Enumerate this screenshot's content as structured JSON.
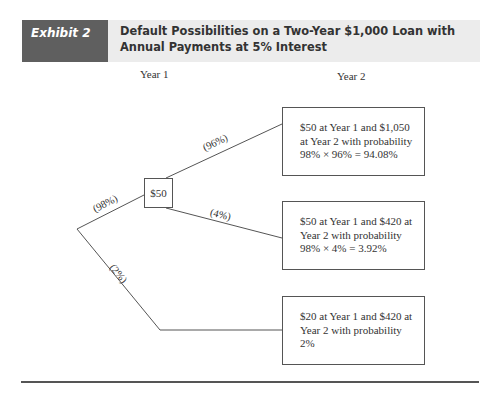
{
  "header": {
    "label": "Exhibit 2",
    "title": "Default Possibilities on a Two-Year $1,000 Loan with Annual Payments at 5% Interest"
  },
  "columns": {
    "year1": "Year 1",
    "year2": "Year 2"
  },
  "tree": {
    "year1_node": "$50",
    "branches": {
      "survive_year1": "(98%)",
      "default_year1": "(2%)",
      "survive_year2": "(96%)",
      "default_year2": "(4%)"
    },
    "outcomes": [
      {
        "line1": "$50 at Year 1 and $1,050",
        "line2": "at Year 2 with probability",
        "line3": "98% × 96% = 94.08%"
      },
      {
        "line1": "$50 at Year 1 and $420 at",
        "line2": "Year 2 with probability",
        "line3": "98% × 4% = 3.92%"
      },
      {
        "line1": "$20 at Year 1 and $420 at",
        "line2": "Year 2 with probability",
        "line3": "2%"
      }
    ]
  },
  "colors": {
    "header_label_bg": "#5f5f5f",
    "header_title_bg": "#ececec",
    "line": "#555555"
  }
}
